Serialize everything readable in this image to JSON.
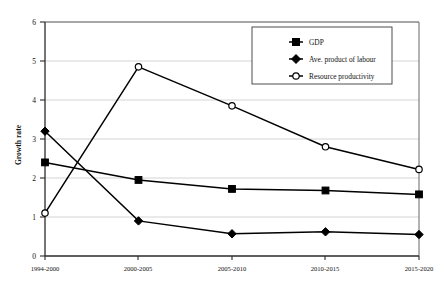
{
  "chart_data": {
    "type": "line",
    "title": "",
    "xlabel": "",
    "ylabel": "Growth rate",
    "categories": [
      "1994-2000",
      "2000-2005",
      "2005-2010",
      "2010-2015",
      "2015-2020"
    ],
    "ylim": [
      0,
      6
    ],
    "yticks": [
      "0",
      "1",
      "2",
      "3",
      "4",
      "5",
      "6"
    ],
    "grid": true,
    "legend_position": "top-right",
    "series": [
      {
        "name": "GDP",
        "marker": "filled-square",
        "color": "#000000",
        "values": [
          2.4,
          1.95,
          1.72,
          1.68,
          1.58
        ]
      },
      {
        "name": "Ave. product of labour",
        "marker": "filled-diamond",
        "color": "#000000",
        "values": [
          3.2,
          0.9,
          0.57,
          0.62,
          0.55
        ]
      },
      {
        "name": "Resource productivity",
        "marker": "open-circle",
        "color": "#000000",
        "values": [
          1.1,
          4.85,
          3.85,
          2.8,
          2.22
        ]
      }
    ]
  },
  "axis": {
    "y_title": "Growth rate"
  }
}
